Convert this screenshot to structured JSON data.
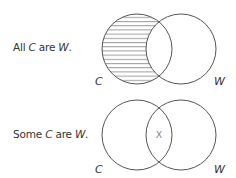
{
  "diagrams": [
    {
      "statement": {
        "pre": "All ",
        "subject": "C",
        "mid": " are ",
        "predicate": "W",
        "post": "."
      },
      "labels": {
        "left": "C",
        "right": "W"
      },
      "shading": "left-only region (C outside W) hatched",
      "marker": ""
    },
    {
      "statement": {
        "pre": "Some ",
        "subject": "C",
        "mid": " are ",
        "predicate": "W",
        "post": "."
      },
      "labels": {
        "left": "C",
        "right": "W"
      },
      "shading": "none",
      "marker": "X"
    }
  ],
  "colors": {
    "stroke": "#555555",
    "hatch": "#777777",
    "text": "#333333",
    "marker": "#888888"
  }
}
